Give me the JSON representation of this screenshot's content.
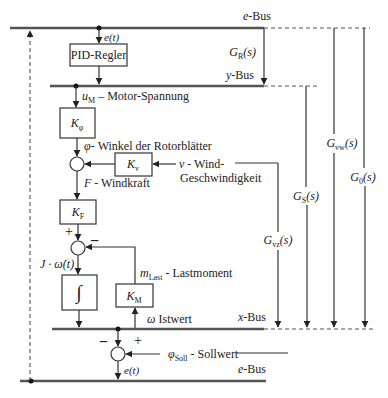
{
  "buses": {
    "e_top": "e-Bus",
    "y": "y-Bus",
    "x": "x-Bus",
    "e_bottom": "e-Bus",
    "e_prefix": "e",
    "y_prefix": "y",
    "x_prefix": "x",
    "suffix": "-Bus"
  },
  "blocks": {
    "pid": "PID-Regler",
    "k_phi": {
      "main": "K",
      "sub": "φ"
    },
    "k_v": {
      "main": "K",
      "sub": "v"
    },
    "k_f": {
      "main": "K",
      "sub": "F"
    },
    "integrator": "∫",
    "k_m": {
      "main": "K",
      "sub": "M"
    }
  },
  "signals": {
    "e_t": "e(t)",
    "u_m": {
      "main": "u",
      "sub": "M",
      "text": " – Motor-Spannung"
    },
    "phi": {
      "main": "φ",
      "text": "- Winkel der Rotorblätter"
    },
    "v": {
      "main": "v",
      "text": " - Wind-",
      "line2": "Geschwindigkeit"
    },
    "f": {
      "main": "F",
      "text": " - Windkraft"
    },
    "j_omega": "J · ω̇(t)",
    "m_last": {
      "main": "m",
      "sub": "Last",
      "text": " - Lastmoment"
    },
    "omega": {
      "main": "ω",
      "text": " Istwert"
    },
    "phi_soll": {
      "main": "φ",
      "sub": "Soll",
      "text": " - Sollwert"
    },
    "e_t_bottom": "e(t)"
  },
  "signs": {
    "plus": "+",
    "minus": "−"
  },
  "transfer_functions": {
    "g_r": {
      "main": "G",
      "sub": "R",
      "arg": "(s)"
    },
    "g_s": {
      "main": "G",
      "sub": "S",
      "arg": "(s)"
    },
    "g_vw": {
      "main": "G",
      "sub": "vw",
      "arg": "(s)"
    },
    "g_0": {
      "main": "G",
      "sub": "0",
      "arg": "(s)"
    },
    "g_vz": {
      "main": "G",
      "sub": "vz",
      "arg": "(s)"
    }
  }
}
